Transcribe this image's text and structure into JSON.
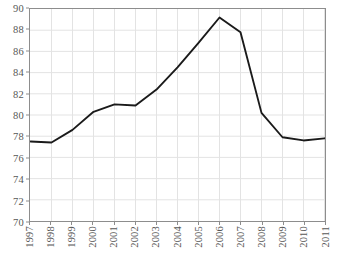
{
  "chart_data": {
    "type": "line",
    "title": "",
    "subtitle": "",
    "xlabel": "",
    "ylabel": "",
    "categories": [
      "1997",
      "1998",
      "1999",
      "2000",
      "2001",
      "2002",
      "2003",
      "2004",
      "2005",
      "2006",
      "2007",
      "2008",
      "2009",
      "2010",
      "2011"
    ],
    "values": [
      77.5,
      77.4,
      78.6,
      80.3,
      81.0,
      80.9,
      82.4,
      84.5,
      86.8,
      89.2,
      87.8,
      80.2,
      77.9,
      77.6,
      77.8
    ],
    "series": [
      {
        "name": "series-1",
        "values": [
          77.5,
          77.4,
          78.6,
          80.3,
          81.0,
          80.9,
          82.4,
          84.5,
          86.8,
          89.2,
          87.8,
          80.2,
          77.9,
          77.6,
          77.8
        ]
      }
    ],
    "x": [
      "1997",
      "1998",
      "1999",
      "2000",
      "2001",
      "2002",
      "2003",
      "2004",
      "2005",
      "2006",
      "2007",
      "2008",
      "2009",
      "2010",
      "2011"
    ],
    "ylim": [
      70,
      90
    ],
    "y_ticks": [
      70,
      72,
      74,
      76,
      78,
      80,
      82,
      84,
      86,
      88,
      90
    ],
    "y_tick_labels": [
      "70",
      "72",
      "74",
      "76",
      "78",
      "80",
      "82",
      "84",
      "86",
      "88",
      "90"
    ],
    "x_tick_labels": [
      "1997",
      "1998",
      "1999",
      "2000",
      "2001",
      "2002",
      "2003",
      "2004",
      "2005",
      "2006",
      "2007",
      "2008",
      "2009",
      "2010",
      "2011"
    ],
    "grid": true,
    "grid_axis": "both",
    "legend": false,
    "legend_position": "none",
    "annotations": [],
    "markers": false,
    "colors": {
      "line": "#1a1a1a",
      "grid": "#e3e3e3",
      "frame": "#8d8d8d",
      "tick_text": "#575757",
      "background": "#ffffff"
    },
    "line_width": 1.9,
    "x_label_rotation": 90
  }
}
